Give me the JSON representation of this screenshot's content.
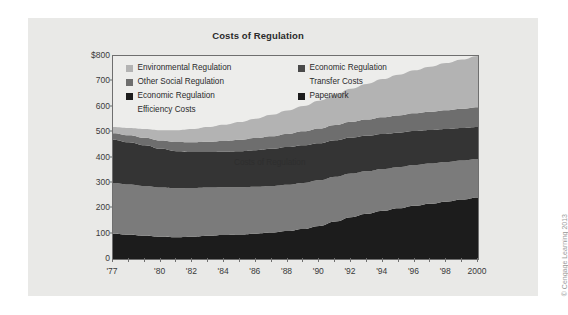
{
  "figure": {
    "credit": "© Cengage Learning 2013"
  },
  "chart_data": {
    "type": "area",
    "stacked": true,
    "title": "Costs of Regulation",
    "xlabel": "",
    "ylabel": "",
    "ylim": [
      0,
      800
    ],
    "yticks": [
      0,
      100,
      200,
      300,
      400,
      500,
      600,
      700,
      800
    ],
    "ytick_labels": [
      "0",
      "100",
      "200",
      "300",
      "400",
      "500",
      "600",
      "700",
      "$800"
    ],
    "xlim": [
      1977,
      2000
    ],
    "xticks": [
      1977,
      1980,
      1982,
      1984,
      1986,
      1988,
      1990,
      1992,
      1994,
      1996,
      1998,
      2000
    ],
    "xtick_labels": [
      "'77",
      "'80",
      "'82",
      "'84",
      "'86",
      "'88",
      "'90",
      "'92",
      "'94",
      "'96",
      "'98",
      "2000"
    ],
    "grid": false,
    "legend_position": "upper-left-inside",
    "annotation": "Costs of Regulation",
    "x": [
      1977,
      1978,
      1979,
      1980,
      1981,
      1982,
      1983,
      1984,
      1985,
      1986,
      1987,
      1988,
      1989,
      1990,
      1991,
      1992,
      1993,
      1994,
      1995,
      1996,
      1997,
      1998,
      1999,
      2000
    ],
    "series": [
      {
        "name": "Paperwork",
        "color": "#1c1c1c",
        "values": [
          100,
          96,
          92,
          88,
          86,
          88,
          92,
          95,
          97,
          100,
          104,
          110,
          118,
          130,
          148,
          165,
          178,
          190,
          200,
          210,
          218,
          226,
          234,
          242
        ]
      },
      {
        "name": "Economic Regulation Transfer Costs",
        "color": "#7b7b7b",
        "values": [
          200,
          198,
          196,
          194,
          193,
          192,
          190,
          188,
          186,
          185,
          184,
          183,
          182,
          180,
          176,
          172,
          168,
          165,
          162,
          160,
          158,
          156,
          154,
          152
        ]
      },
      {
        "name": "Economic Regulation Efficiency Costs",
        "color": "#343434",
        "values": [
          170,
          166,
          160,
          152,
          146,
          142,
          140,
          140,
          142,
          144,
          146,
          148,
          148,
          146,
          144,
          142,
          140,
          138,
          136,
          134,
          132,
          130,
          128,
          126
        ]
      },
      {
        "name": "Other Social Regulation",
        "color": "#6e6e6e",
        "values": [
          26,
          28,
          30,
          33,
          36,
          38,
          40,
          42,
          45,
          48,
          50,
          52,
          55,
          58,
          60,
          62,
          64,
          66,
          68,
          70,
          72,
          74,
          76,
          78
        ]
      },
      {
        "name": "Environmental Regulation",
        "color": "#b3b3b3",
        "values": [
          24,
          28,
          34,
          40,
          46,
          52,
          58,
          64,
          70,
          76,
          84,
          92,
          100,
          110,
          120,
          130,
          140,
          150,
          160,
          170,
          178,
          186,
          194,
          202
        ]
      }
    ]
  },
  "legend": {
    "left_column": [
      {
        "label": "Environmental Regulation",
        "color": "#b3b3b3"
      },
      {
        "label": "Other Social Regulation",
        "color": "#6e6e6e"
      },
      {
        "label": "Economic Regulation",
        "color": "#1c1c1c",
        "continuation": "Efficiency Costs"
      }
    ],
    "right_column": [
      {
        "label": "Economic Regulation",
        "color": "#4a4a4a",
        "continuation": "Transfer Costs"
      },
      {
        "label": "Paperwork",
        "color": "#1c1c1c"
      }
    ]
  }
}
